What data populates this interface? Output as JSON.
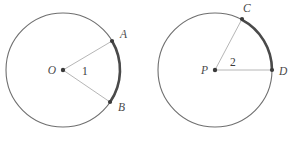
{
  "figure": {
    "type": "geometry-diagram",
    "background_color": "#ffffff",
    "colors": {
      "circle_stroke": "#6f6f6f",
      "arc_highlight": "#4a4a4a",
      "radius_line": "#b6b6b6",
      "vertex_dot": "#3b3b3b",
      "label_text": "#4a4a4a"
    },
    "circles": [
      {
        "id": "circle-o",
        "center_label": "O",
        "center": {
          "x": 63,
          "y": 70
        },
        "radius": 57,
        "angle_label": "1",
        "angle_label_pos": {
          "x": 82,
          "y": 75
        },
        "points": [
          {
            "label": "A",
            "x": 112,
            "y": 41,
            "label_x": 120,
            "label_y": 38
          },
          {
            "label": "B",
            "x": 110,
            "y": 102,
            "label_x": 118,
            "label_y": 111
          }
        ],
        "arc": {
          "from": "A",
          "to": "B",
          "highlighted": true
        }
      },
      {
        "id": "circle-p",
        "center_label": "P",
        "center": {
          "x": 215,
          "y": 70
        },
        "radius": 57,
        "angle_label": "2",
        "angle_label_pos": {
          "x": 230,
          "y": 66
        },
        "points": [
          {
            "label": "C",
            "x": 242,
            "y": 19,
            "label_x": 243,
            "label_y": 12
          },
          {
            "label": "D",
            "x": 272,
            "y": 70,
            "label_x": 279,
            "label_y": 75
          }
        ],
        "arc": {
          "from": "C",
          "to": "D",
          "highlighted": true
        }
      }
    ]
  }
}
